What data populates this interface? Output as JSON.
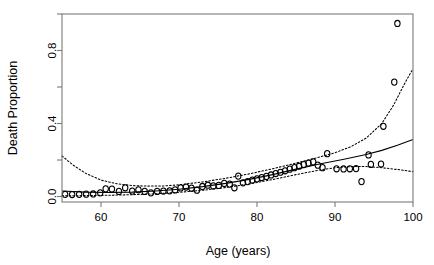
{
  "chart_data": {
    "type": "scatter",
    "title": "",
    "xlabel": "Age (years)",
    "ylabel": "Death Proportion",
    "xlim": [
      55,
      100
    ],
    "ylim": [
      -0.03,
      1.0
    ],
    "xticks": [
      60,
      70,
      80,
      90,
      100
    ],
    "xtick_labels": [
      "60",
      "70",
      "80",
      "90",
      "100"
    ],
    "yticks": [
      0.0,
      0.4,
      0.8
    ],
    "ytick_labels": [
      "0.0",
      "0.4",
      "0.8"
    ],
    "minor_yticks": [
      0.2,
      0.6,
      1.0
    ],
    "grid": false,
    "legend": false,
    "marker": "open-circle",
    "points": [
      {
        "x": 55.4,
        "y": 0.012
      },
      {
        "x": 56.3,
        "y": 0.011
      },
      {
        "x": 57.2,
        "y": 0.012
      },
      {
        "x": 58.1,
        "y": 0.013
      },
      {
        "x": 59.0,
        "y": 0.014
      },
      {
        "x": 59.9,
        "y": 0.02
      },
      {
        "x": 60.6,
        "y": 0.042
      },
      {
        "x": 61.4,
        "y": 0.041
      },
      {
        "x": 62.3,
        "y": 0.028
      },
      {
        "x": 63.1,
        "y": 0.048
      },
      {
        "x": 64.0,
        "y": 0.03
      },
      {
        "x": 64.8,
        "y": 0.037
      },
      {
        "x": 65.6,
        "y": 0.028
      },
      {
        "x": 66.4,
        "y": 0.02
      },
      {
        "x": 67.2,
        "y": 0.028
      },
      {
        "x": 68.0,
        "y": 0.03
      },
      {
        "x": 68.8,
        "y": 0.031
      },
      {
        "x": 69.5,
        "y": 0.036
      },
      {
        "x": 70.2,
        "y": 0.047
      },
      {
        "x": 70.9,
        "y": 0.052
      },
      {
        "x": 71.6,
        "y": 0.046
      },
      {
        "x": 72.3,
        "y": 0.035
      },
      {
        "x": 73.0,
        "y": 0.055
      },
      {
        "x": 73.7,
        "y": 0.062
      },
      {
        "x": 74.4,
        "y": 0.058
      },
      {
        "x": 75.1,
        "y": 0.061
      },
      {
        "x": 75.8,
        "y": 0.072
      },
      {
        "x": 76.5,
        "y": 0.068
      },
      {
        "x": 77.1,
        "y": 0.048
      },
      {
        "x": 77.6,
        "y": 0.112
      },
      {
        "x": 78.2,
        "y": 0.075
      },
      {
        "x": 78.8,
        "y": 0.082
      },
      {
        "x": 79.4,
        "y": 0.09
      },
      {
        "x": 80.0,
        "y": 0.097
      },
      {
        "x": 80.6,
        "y": 0.104
      },
      {
        "x": 81.2,
        "y": 0.11
      },
      {
        "x": 81.8,
        "y": 0.118
      },
      {
        "x": 82.4,
        "y": 0.126
      },
      {
        "x": 83.0,
        "y": 0.133
      },
      {
        "x": 83.6,
        "y": 0.141
      },
      {
        "x": 84.2,
        "y": 0.15
      },
      {
        "x": 84.8,
        "y": 0.158
      },
      {
        "x": 85.4,
        "y": 0.166
      },
      {
        "x": 86.0,
        "y": 0.175
      },
      {
        "x": 86.6,
        "y": 0.183
      },
      {
        "x": 87.2,
        "y": 0.19
      },
      {
        "x": 87.8,
        "y": 0.172
      },
      {
        "x": 88.4,
        "y": 0.158
      },
      {
        "x": 89.0,
        "y": 0.235
      },
      {
        "x": 90.2,
        "y": 0.152
      },
      {
        "x": 91.1,
        "y": 0.151
      },
      {
        "x": 91.9,
        "y": 0.152
      },
      {
        "x": 92.7,
        "y": 0.153
      },
      {
        "x": 93.4,
        "y": 0.082
      },
      {
        "x": 94.3,
        "y": 0.228
      },
      {
        "x": 94.6,
        "y": 0.176
      },
      {
        "x": 95.9,
        "y": 0.178
      },
      {
        "x": 96.2,
        "y": 0.385
      },
      {
        "x": 97.6,
        "y": 0.627
      },
      {
        "x": 98.0,
        "y": 0.948
      }
    ],
    "fit_curve": {
      "name": "fitted-mean",
      "style": "solid",
      "points": [
        {
          "x": 55.0,
          "y": 0.03
        },
        {
          "x": 58.0,
          "y": 0.024
        },
        {
          "x": 61.0,
          "y": 0.022
        },
        {
          "x": 64.0,
          "y": 0.024
        },
        {
          "x": 67.0,
          "y": 0.03
        },
        {
          "x": 70.0,
          "y": 0.04
        },
        {
          "x": 73.0,
          "y": 0.054
        },
        {
          "x": 76.0,
          "y": 0.072
        },
        {
          "x": 79.0,
          "y": 0.094
        },
        {
          "x": 82.0,
          "y": 0.12
        },
        {
          "x": 85.0,
          "y": 0.15
        },
        {
          "x": 88.0,
          "y": 0.178
        },
        {
          "x": 91.0,
          "y": 0.203
        },
        {
          "x": 94.0,
          "y": 0.23
        },
        {
          "x": 96.0,
          "y": 0.253
        },
        {
          "x": 98.0,
          "y": 0.281
        },
        {
          "x": 100.0,
          "y": 0.312
        }
      ]
    },
    "bands": [
      {
        "name": "upper-confidence-band",
        "style": "dotted",
        "points": [
          {
            "x": 55.0,
            "y": 0.222
          },
          {
            "x": 56.5,
            "y": 0.17
          },
          {
            "x": 58.0,
            "y": 0.128
          },
          {
            "x": 60.0,
            "y": 0.09
          },
          {
            "x": 62.0,
            "y": 0.07
          },
          {
            "x": 64.0,
            "y": 0.06
          },
          {
            "x": 66.0,
            "y": 0.057
          },
          {
            "x": 68.0,
            "y": 0.058
          },
          {
            "x": 70.0,
            "y": 0.064
          },
          {
            "x": 73.0,
            "y": 0.08
          },
          {
            "x": 76.0,
            "y": 0.1
          },
          {
            "x": 79.0,
            "y": 0.124
          },
          {
            "x": 82.0,
            "y": 0.152
          },
          {
            "x": 85.0,
            "y": 0.183
          },
          {
            "x": 88.0,
            "y": 0.216
          },
          {
            "x": 90.0,
            "y": 0.24
          },
          {
            "x": 92.0,
            "y": 0.272
          },
          {
            "x": 94.0,
            "y": 0.32
          },
          {
            "x": 96.0,
            "y": 0.4
          },
          {
            "x": 97.5,
            "y": 0.5
          },
          {
            "x": 99.0,
            "y": 0.625
          },
          {
            "x": 100.0,
            "y": 0.7
          }
        ]
      },
      {
        "name": "lower-confidence-band",
        "style": "dotted",
        "points": [
          {
            "x": 55.0,
            "y": 0.004
          },
          {
            "x": 58.0,
            "y": 0.005
          },
          {
            "x": 61.0,
            "y": 0.007
          },
          {
            "x": 64.0,
            "y": 0.01
          },
          {
            "x": 67.0,
            "y": 0.015
          },
          {
            "x": 70.0,
            "y": 0.023
          },
          {
            "x": 73.0,
            "y": 0.034
          },
          {
            "x": 76.0,
            "y": 0.049
          },
          {
            "x": 79.0,
            "y": 0.069
          },
          {
            "x": 82.0,
            "y": 0.093
          },
          {
            "x": 85.0,
            "y": 0.12
          },
          {
            "x": 88.0,
            "y": 0.145
          },
          {
            "x": 90.0,
            "y": 0.158
          },
          {
            "x": 92.0,
            "y": 0.164
          },
          {
            "x": 94.0,
            "y": 0.164
          },
          {
            "x": 96.0,
            "y": 0.158
          },
          {
            "x": 98.0,
            "y": 0.148
          },
          {
            "x": 100.0,
            "y": 0.136
          }
        ]
      }
    ],
    "colors": {
      "point": "#000000",
      "fit": "#000000",
      "band": "#000000",
      "frame": "#7a7a7a",
      "background": "#ffffff"
    }
  }
}
